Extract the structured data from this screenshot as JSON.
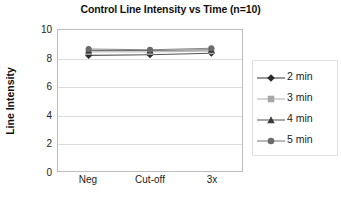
{
  "chart_data": {
    "type": "line",
    "title": "Control Line Intensity vs Time (n=10)",
    "xlabel": "",
    "ylabel": "Line Intensity",
    "categories": [
      "Neg",
      "Cut-off",
      "3x"
    ],
    "ylim": [
      0,
      10
    ],
    "yticks": [
      0,
      2,
      4,
      6,
      8,
      10
    ],
    "grid": true,
    "legend_position": "right",
    "series": [
      {
        "name": "2 min",
        "marker": "diamond",
        "color": "#2b2b2b",
        "line_color": "#555555",
        "values": [
          8.2,
          8.25,
          8.35
        ]
      },
      {
        "name": "3 min",
        "marker": "square",
        "color": "#a8a8a8",
        "line_color": "#bdbdbd",
        "values": [
          8.45,
          8.45,
          8.5
        ]
      },
      {
        "name": "4 min",
        "marker": "triangle",
        "color": "#3a3a3a",
        "line_color": "#6e6e6e",
        "values": [
          8.55,
          8.55,
          8.6
        ]
      },
      {
        "name": "5 min",
        "marker": "circle",
        "color": "#6b6b6b",
        "line_color": "#8a8a8a",
        "values": [
          8.65,
          8.6,
          8.7
        ]
      }
    ]
  },
  "yticklabels": [
    "10",
    "8",
    "6",
    "4",
    "2",
    "0"
  ],
  "legend": {
    "items": [
      {
        "label": "2 min"
      },
      {
        "label": "3 min"
      },
      {
        "label": "4 min"
      },
      {
        "label": "5 min"
      }
    ]
  }
}
